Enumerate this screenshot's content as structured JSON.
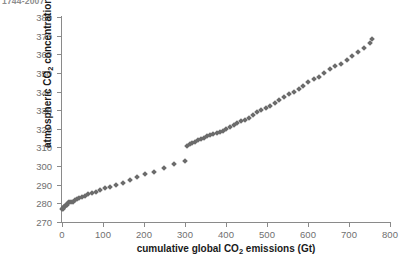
{
  "caption": "1744-2007",
  "chart_data": {
    "type": "scatter",
    "title": "1744-2007",
    "xlabel": "cumulative global CO2 emissions (Gt)",
    "ylabel": "atmospheric CO2 concentration (ppm)",
    "xlabel_parts": {
      "pre": "cumulative global CO",
      "sub": "2",
      "post": " emissions (Gt)"
    },
    "ylabel_parts": {
      "pre": "atmospheric CO",
      "sub": "2",
      "post": " concentration (ppm)"
    },
    "xlim": [
      0,
      800
    ],
    "ylim": [
      270,
      380
    ],
    "xticks": [
      0,
      100,
      200,
      300,
      400,
      500,
      600,
      700,
      800
    ],
    "yticks": [
      270,
      280,
      290,
      300,
      310,
      320,
      330,
      340,
      350,
      360,
      370,
      380
    ],
    "grid": false,
    "legend": null,
    "marker": "diamond",
    "marker_color": "#6b6b6b",
    "marker_size": 4,
    "x": [
      1,
      2,
      3,
      4,
      6,
      8,
      10,
      12,
      15,
      18,
      22,
      26,
      31,
      36,
      42,
      48,
      55,
      63,
      72,
      82,
      93,
      105,
      118,
      132,
      148,
      165,
      183,
      203,
      225,
      248,
      273,
      300,
      306,
      312,
      318,
      325,
      332,
      339,
      346,
      353,
      361,
      369,
      377,
      385,
      393,
      401,
      410,
      419,
      428,
      437,
      446,
      456,
      466,
      476,
      486,
      497,
      508,
      519,
      530,
      541,
      553,
      565,
      577,
      589,
      601,
      614,
      627,
      640,
      653,
      666,
      680,
      694,
      708,
      722,
      736,
      750,
      757
    ],
    "y": [
      277,
      277,
      277.5,
      278,
      278,
      278.5,
      279,
      279,
      280,
      280.5,
      281,
      281,
      282,
      282.5,
      283,
      283.5,
      284,
      285,
      285.5,
      286,
      287,
      288,
      289,
      290,
      291,
      292.5,
      294,
      295.5,
      297,
      299,
      301,
      303,
      311,
      312,
      312.5,
      313,
      314,
      314.5,
      315,
      316,
      316.5,
      317,
      318,
      318.5,
      319,
      320,
      321,
      322,
      323,
      324,
      325,
      326,
      327.5,
      329,
      330,
      331,
      332.5,
      334,
      335.5,
      337,
      338.5,
      340,
      341.5,
      343,
      345,
      346.5,
      348,
      350,
      352,
      353.5,
      355,
      357,
      359,
      361,
      363.5,
      366,
      368
    ]
  }
}
